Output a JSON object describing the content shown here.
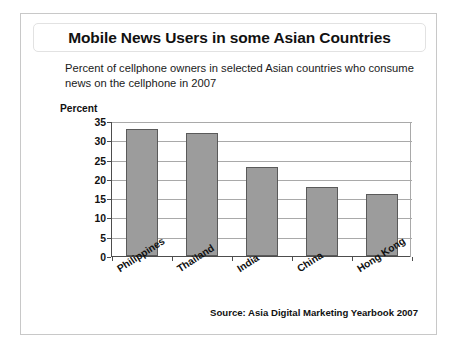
{
  "slide": {
    "title": "Mobile News Users in some Asian Countries",
    "subtitle": "Percent of cellphone owners in selected Asian countries who consume news on the cellphone in 2007",
    "source": "Source: Asia Digital Marketing Yearbook 2007"
  },
  "chart_data": {
    "type": "bar",
    "title": "Mobile News Users in some Asian Countries",
    "subtitle": "Percent of cellphone owners in selected Asian countries who consume news on the cellphone in 2007",
    "categories": [
      "Philippines",
      "Thailand",
      "India",
      "China",
      "Hong Kong"
    ],
    "values": [
      33,
      32,
      23,
      18,
      16
    ],
    "series": [
      {
        "name": "Percent",
        "values": [
          33,
          32,
          23,
          18,
          16
        ]
      }
    ],
    "xlabel": "",
    "ylabel": "Percent",
    "ylim": [
      0,
      35
    ],
    "yticks": [
      0,
      5,
      10,
      15,
      20,
      25,
      30,
      35
    ],
    "ytick_labels": [
      "0",
      "5",
      "10",
      "15",
      "20",
      "25",
      "30",
      "35"
    ],
    "grid": true,
    "gridlines": "horizontal",
    "legend": false,
    "legend_position": "none",
    "bar_color": "#9c9c9c",
    "bar_edge_color": "#5a5a5a",
    "axis_color": "#4d4d4d",
    "grid_color": "#a9a9a9",
    "source": "Source: Asia Digital Marketing Yearbook 2007"
  }
}
